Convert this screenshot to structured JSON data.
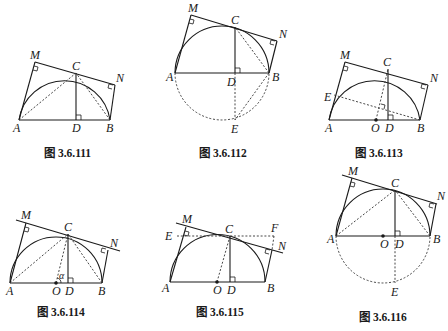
{
  "figures": [
    {
      "id": "fig-3-6-111",
      "caption": "图 3.6.111",
      "points": {
        "A": "A",
        "B": "B",
        "C": "C",
        "D": "D",
        "M": "M",
        "N": "N"
      }
    },
    {
      "id": "fig-3-6-112",
      "caption": "图 3.6.112",
      "points": {
        "A": "A",
        "B": "B",
        "C": "C",
        "D": "D",
        "E": "E",
        "M": "M",
        "N": "N"
      }
    },
    {
      "id": "fig-3-6-113",
      "caption": "图 3.6.113",
      "points": {
        "A": "A",
        "B": "B",
        "C": "C",
        "D": "D",
        "E": "E",
        "M": "M",
        "N": "N",
        "O": "O"
      }
    },
    {
      "id": "fig-3-6-114",
      "caption": "图 3.6.114",
      "points": {
        "A": "A",
        "B": "B",
        "C": "C",
        "D": "D",
        "M": "M",
        "N": "N",
        "O": "O"
      },
      "angle_label": "α"
    },
    {
      "id": "fig-3-6-115",
      "caption": "图 3.6.115",
      "points": {
        "A": "A",
        "B": "B",
        "C": "C",
        "D": "D",
        "E": "E",
        "F": "F",
        "M": "M",
        "N": "N",
        "O": "O"
      }
    },
    {
      "id": "fig-3-6-116",
      "caption": "图 3.6.116",
      "points": {
        "A": "A",
        "B": "B",
        "C": "C",
        "D": "D",
        "E": "E",
        "M": "M",
        "N": "N",
        "O": "O"
      }
    }
  ],
  "colors": {
    "line": "#1a1a1a",
    "background": "#ffffff"
  }
}
